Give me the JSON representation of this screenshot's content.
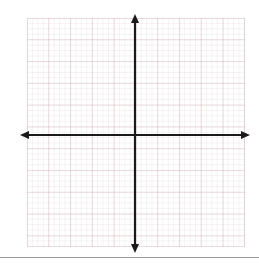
{
  "figure": {
    "kind": "blank-cartesian-coordinate-plane",
    "title": "",
    "caption": ""
  },
  "chart_data": {
    "type": "scatter",
    "title": "",
    "subtitle": "",
    "xlabel": "",
    "ylabel": "",
    "series": [],
    "x": [],
    "values": [],
    "categories": [],
    "annotations": [],
    "legend": {
      "entries": [],
      "position": "none"
    },
    "grid": {
      "visible": true,
      "major_cells_x": 10,
      "major_cells_y": 10,
      "minor_per_major": 4,
      "major_color": "#ceaab2",
      "minor_color": "#d6c4c8"
    },
    "axes": {
      "x": {
        "visible": true,
        "arrow_start": true,
        "arrow_end": true,
        "tick_labels": [],
        "xlim": [
          -5,
          5
        ],
        "color": "#1a1a1a"
      },
      "y": {
        "visible": true,
        "arrow_start": true,
        "arrow_end": true,
        "tick_labels": [],
        "ylim": [
          -5,
          5
        ],
        "color": "#1a1a1a"
      }
    },
    "origin_label": "",
    "background": "#ffffff"
  },
  "geometry": {
    "grid_left": 27,
    "grid_top": 18,
    "grid_width": 218,
    "grid_height": 229,
    "origin_x": 135,
    "origin_y": 135,
    "x_axis_left_tip": 20,
    "x_axis_right_tip": 250,
    "y_axis_top_tip": 14,
    "y_axis_bottom_tip": 253,
    "axis_stroke_width": 2.2,
    "bottom_rule_y": 257
  },
  "colors": {
    "axis": "#1a1a1a",
    "grid_major": "#ceaab2",
    "grid_minor": "#d6c4c8",
    "page_background": "#ffffff",
    "bottom_rule": "#9a9a9a"
  }
}
